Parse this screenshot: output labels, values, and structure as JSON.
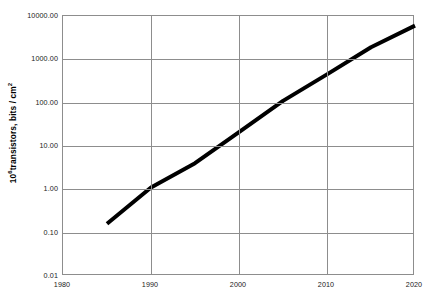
{
  "chart_data": {
    "type": "line",
    "title": "",
    "subtitle": "",
    "xlabel": "",
    "ylabel": "10^6 transistors, bits / cm^2",
    "ylabel_base": "10",
    "ylabel_exponent": "6",
    "ylabel_rest": "transistors, bits / cm",
    "ylabel_rest_exponent": "2",
    "xlim": [
      1980,
      2020
    ],
    "ylim": [
      0.01,
      10000
    ],
    "yscale": "log",
    "xscale": "linear",
    "grid": true,
    "legend": false,
    "legend_position": "none",
    "x_ticks": [
      1980,
      1990,
      2000,
      2010,
      2020
    ],
    "x_tick_labels": [
      "1980",
      "1990",
      "2000",
      "2010",
      "2020"
    ],
    "y_ticks": [
      0.01,
      0.1,
      1,
      10,
      100,
      1000,
      10000
    ],
    "y_tick_labels": [
      "0.01",
      "0.10",
      "1.00",
      "10.00",
      "100.00",
      "1000.00",
      "10000.00"
    ],
    "series": [
      {
        "name": "transistor density",
        "color": "#000000",
        "linewidth": 4,
        "x": [
          1985,
          1990,
          1995,
          2000,
          2005,
          2010,
          2015,
          2020
        ],
        "y": [
          0.16,
          1.1,
          4.0,
          21,
          110,
          450,
          1900,
          6000
        ]
      }
    ],
    "annotations": []
  }
}
